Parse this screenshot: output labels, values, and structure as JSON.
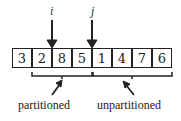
{
  "array": {
    "cells": [
      "3",
      "2",
      "8",
      "5",
      "1",
      "4",
      "7",
      "6"
    ]
  },
  "pointers": {
    "i": "i",
    "j": "j"
  },
  "labels": {
    "partitioned": "partitioned",
    "unpartitioned": "unpartitioned"
  }
}
